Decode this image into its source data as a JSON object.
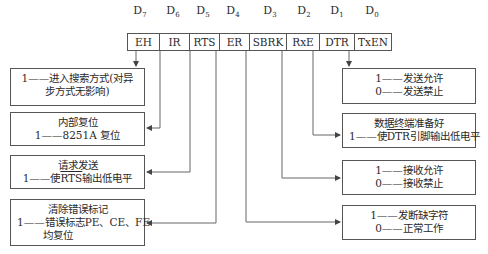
{
  "register": {
    "bits": [
      {
        "index": "7",
        "name": "EH"
      },
      {
        "index": "6",
        "name": "IR"
      },
      {
        "index": "5",
        "name": "RTS"
      },
      {
        "index": "4",
        "name": "ER"
      },
      {
        "index": "3",
        "name": "SBRK"
      },
      {
        "index": "2",
        "name": "RxE"
      },
      {
        "index": "1",
        "name": "DTR"
      },
      {
        "index": "0",
        "name": "TxEN"
      }
    ],
    "bit_prefix": "D"
  },
  "left_boxes": [
    {
      "title": "",
      "lines": [
        "1——进入搜索方式(对异",
        "步方式无影响)"
      ]
    },
    {
      "title": "内部复位",
      "lines": [
        "1——8251A 复位"
      ]
    },
    {
      "title": "请求发送",
      "lines_pre": "1——使",
      "lines_over": "RTS",
      "lines_post": "输出低电平"
    },
    {
      "title": "清除错误标记",
      "lines": [
        "1——错误标志PE、CE、FE",
        "均复位"
      ]
    }
  ],
  "right_boxes": [
    {
      "title": "",
      "lines": [
        "1——发送允许",
        "0——发送禁止"
      ]
    },
    {
      "title": "数据终端准备好",
      "lines_pre": "1——使",
      "lines_over": "DTR",
      "lines_post": "引脚输出低电平"
    },
    {
      "title": "",
      "lines": [
        "1——接收允许",
        "0——接收禁止"
      ]
    },
    {
      "title": "",
      "lines": [
        "1——发断缺字符",
        "0——正常工作"
      ]
    }
  ]
}
